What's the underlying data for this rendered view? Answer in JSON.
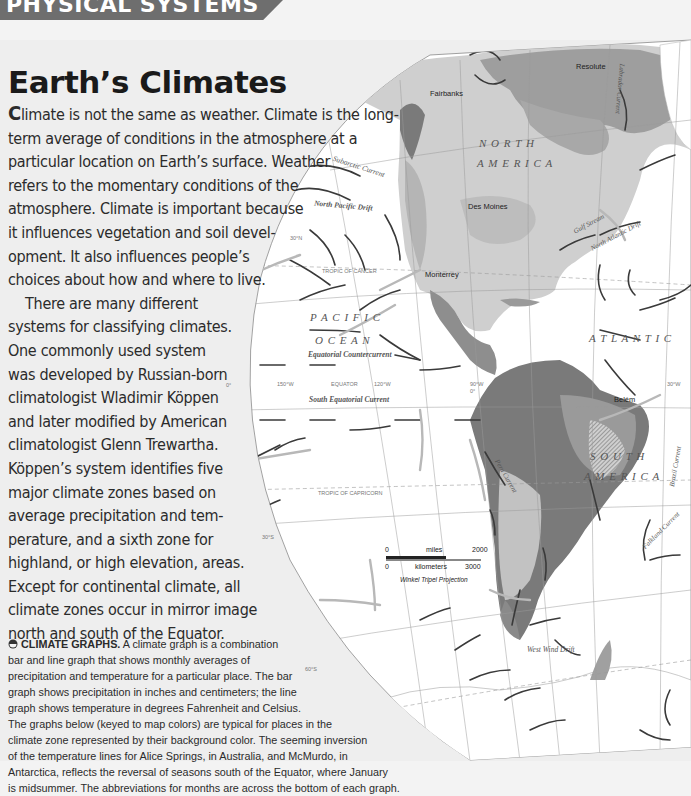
{
  "section_banner": "PHYSICAL SYSTEMS",
  "article": {
    "title": "Earth’s Climates",
    "dropcap": "C",
    "lines": [
      "limate is not the same as weather. Climate is the long-",
      "term average of conditions in the atmosphere at a",
      "particular location on Earth’s surface. Weather",
      "refers to the momentary conditions of the",
      "atmosphere. Climate is important because",
      "it influences vegetation and soil devel-",
      "opment. It also influences people’s",
      "choices about how and where to live.",
      "    There are many different",
      "systems for classifying climates.",
      "One commonly used system",
      "was developed by Russian-born",
      "climatologist Wladimir Köppen",
      "and later modified by American",
      "climatologist Glenn Trewartha.",
      "Köppen’s system identifies five",
      "major climate zones based on",
      "average precipitation and tem-",
      "perature, and a sixth zone for",
      "highland, or high elevation, areas.",
      "Except for continental climate, all",
      "climate zones occur in mirror image",
      "north and south of the Equator."
    ]
  },
  "caption": {
    "icon": "circle-half-icon",
    "heading": "CLIMATE GRAPHS.",
    "first_line_rest": " A climate graph is a combination",
    "lines": [
      "bar and line graph that shows monthly averages of",
      "precipitation and temperature for a particular place. The bar",
      "graph shows precipitation in inches and centimeters; the line",
      "graph shows temperature in degrees Fahrenheit and Celsius.",
      "The graphs below (keyed to map colors) are typical for places in the",
      "climate zone represented by their background color. The seeming inversion",
      "of the temperature lines for Alice Springs, in Australia, and McMurdo, in",
      "Antarctica, reflects the reversal of seasons south of the Equator, where January",
      "is midsummer. The abbreviations for months are across the bottom of each graph."
    ]
  },
  "map": {
    "regions": {
      "north_america": "N O R T H",
      "north_america_2": "A M E R I C A",
      "south_america": "S O U T H",
      "south_america_2": "A M E R I C A",
      "pacific": "P A C I F I C",
      "pacific_2": "O C E A N",
      "atlantic": "A T L A N T I C"
    },
    "currents": {
      "subarctic": "Subarctic Current",
      "north_pacific": "North Pacific Drift",
      "labrador": "Labrador Current",
      "gulf_stream": "Gulf Stream",
      "north_atlantic": "North Atlantic Drift",
      "eq_counter": "Equatorial Countercurrent",
      "south_eq": "South Equatorial Current",
      "peru": "Peru Current",
      "brazil": "Brazil Current",
      "falkland": "Falkland Current",
      "west_wind": "West Wind Drift"
    },
    "cities": {
      "resolute": "Resolute",
      "fairbanks": "Fairbanks",
      "des_moines": "Des Moines",
      "monterrey": "Monterrey",
      "belem": "Belém"
    },
    "grid_labels": {
      "lat30n": "30°N",
      "tropic_cancer": "TROPIC OF CANCER",
      "equator_0": "0°",
      "lon150": "150°W",
      "equator": "EQUATOR",
      "lon120": "120°W",
      "lon90": "90°W",
      "lat0b": "0°",
      "lon30": "30°W",
      "tropic_capricorn": "TROPIC OF CAPRICORN",
      "lat30s": "30°S",
      "lat60s": "60°S"
    },
    "scale": {
      "zero_mi": "0",
      "miles": "miles",
      "mi_max": "2000",
      "zero_km": "0",
      "km": "kilometers",
      "km_max": "3000",
      "projection": "Winkel Tripel Projection"
    }
  }
}
